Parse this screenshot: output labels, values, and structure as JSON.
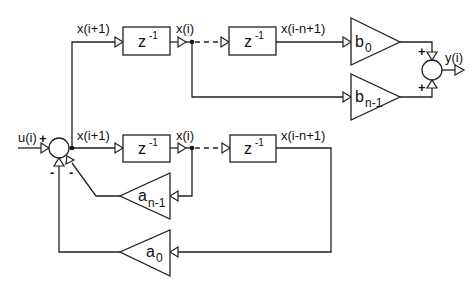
{
  "diagram": {
    "type": "block-diagram",
    "signals": {
      "input": "u(i)",
      "output": "y(i)",
      "top_xi1": "x(i+1)",
      "top_xi": "x(i)",
      "top_xin1": "x(i-n+1)",
      "bot_xi1": "x(i+1)",
      "bot_xi": "x(i)",
      "bot_xin1": "x(i-n+1)"
    },
    "delays": {
      "base": "z",
      "exp": "-1"
    },
    "gains": {
      "b0": {
        "base": "b",
        "sub": "0"
      },
      "bn1": {
        "base": "b",
        "sub": "n-1"
      },
      "an1": {
        "base": "a",
        "sub": "n-1"
      },
      "a0": {
        "base": "a",
        "sub": "0"
      }
    },
    "signs": {
      "input_sum_u": "+",
      "input_sum_a0": "-",
      "input_sum_an1": "-",
      "output_sum_b0": "+",
      "output_sum_bn1": "+"
    }
  }
}
